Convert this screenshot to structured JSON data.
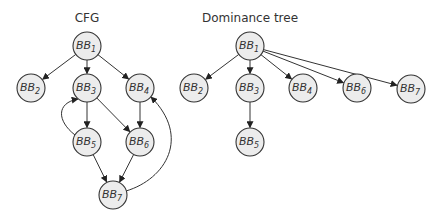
{
  "diagrams": [
    {
      "id": "cfg",
      "title": "CFG",
      "nodes": [
        {
          "id": "BB1",
          "base": "BB",
          "sub": "1"
        },
        {
          "id": "BB2",
          "base": "BB",
          "sub": "2"
        },
        {
          "id": "BB3",
          "base": "BB",
          "sub": "3"
        },
        {
          "id": "BB4",
          "base": "BB",
          "sub": "4"
        },
        {
          "id": "BB5",
          "base": "BB",
          "sub": "5"
        },
        {
          "id": "BB6",
          "base": "BB",
          "sub": "6"
        },
        {
          "id": "BB7",
          "base": "BB",
          "sub": "7"
        }
      ],
      "edges": [
        {
          "from": "BB1",
          "to": "BB2"
        },
        {
          "from": "BB1",
          "to": "BB3"
        },
        {
          "from": "BB1",
          "to": "BB4"
        },
        {
          "from": "BB3",
          "to": "BB5"
        },
        {
          "from": "BB3",
          "to": "BB6"
        },
        {
          "from": "BB4",
          "to": "BB6"
        },
        {
          "from": "BB5",
          "to": "BB3"
        },
        {
          "from": "BB5",
          "to": "BB7"
        },
        {
          "from": "BB6",
          "to": "BB7"
        },
        {
          "from": "BB7",
          "to": "BB4"
        }
      ]
    },
    {
      "id": "dominance-tree",
      "title": "Dominance tree",
      "nodes": [
        {
          "id": "BB1",
          "base": "BB",
          "sub": "1"
        },
        {
          "id": "BB2",
          "base": "BB",
          "sub": "2"
        },
        {
          "id": "BB3",
          "base": "BB",
          "sub": "3"
        },
        {
          "id": "BB4",
          "base": "BB",
          "sub": "4"
        },
        {
          "id": "BB6",
          "base": "BB",
          "sub": "6"
        },
        {
          "id": "BB7",
          "base": "BB",
          "sub": "7"
        },
        {
          "id": "BB5",
          "base": "BB",
          "sub": "5"
        }
      ],
      "edges": [
        {
          "from": "BB1",
          "to": "BB2"
        },
        {
          "from": "BB1",
          "to": "BB3"
        },
        {
          "from": "BB1",
          "to": "BB4"
        },
        {
          "from": "BB1",
          "to": "BB6"
        },
        {
          "from": "BB1",
          "to": "BB7"
        },
        {
          "from": "BB3",
          "to": "BB5"
        }
      ]
    }
  ]
}
